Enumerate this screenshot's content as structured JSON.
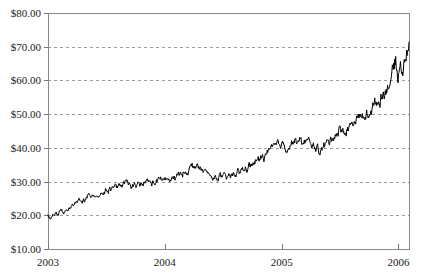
{
  "chart_data": {
    "type": "line",
    "title": "",
    "subtitle": "",
    "xlabel": "",
    "ylabel": "",
    "legend": [],
    "legend_position": "none",
    "grid": true,
    "grid_style": "horizontal-dashed",
    "background": "#ffffff",
    "series_color": "#000000",
    "xlim": [
      "2003",
      "2006.1"
    ],
    "ylim": [
      10,
      80
    ],
    "ytick_values": [
      10,
      20,
      30,
      40,
      50,
      60,
      70,
      80
    ],
    "ytick_labels": [
      "$10.00",
      "$20.00",
      "$30.00",
      "$40.00",
      "$50.00",
      "$60.00",
      "$70.00",
      "$80.00"
    ],
    "ytick_prefix": "$",
    "ytick_step": 10,
    "xtick_labels": [
      "2003",
      "2004",
      "2005",
      "2006"
    ],
    "xtick_positions": [
      0,
      1,
      2,
      3
    ],
    "x_span_years": 3.09,
    "series": [
      {
        "name": "price",
        "color": "#000000",
        "note": "daily closing price, ~780 points from start of 2003 to early 2006",
        "anchors": [
          {
            "x": 0.0,
            "y": 19.6
          },
          {
            "x": 0.02,
            "y": 19.2
          },
          {
            "x": 0.05,
            "y": 20.1
          },
          {
            "x": 0.08,
            "y": 20.5
          },
          {
            "x": 0.12,
            "y": 21.4
          },
          {
            "x": 0.16,
            "y": 21.1
          },
          {
            "x": 0.2,
            "y": 22.3
          },
          {
            "x": 0.24,
            "y": 23.6
          },
          {
            "x": 0.28,
            "y": 24.9
          },
          {
            "x": 0.31,
            "y": 24.2
          },
          {
            "x": 0.35,
            "y": 25.6
          },
          {
            "x": 0.39,
            "y": 26.4
          },
          {
            "x": 0.43,
            "y": 25.8
          },
          {
            "x": 0.47,
            "y": 26.9
          },
          {
            "x": 0.52,
            "y": 27.4
          },
          {
            "x": 0.56,
            "y": 28.8
          },
          {
            "x": 0.6,
            "y": 28.1
          },
          {
            "x": 0.65,
            "y": 29.6
          },
          {
            "x": 0.7,
            "y": 29.0
          },
          {
            "x": 0.75,
            "y": 28.4
          },
          {
            "x": 0.8,
            "y": 29.2
          },
          {
            "x": 0.85,
            "y": 30.1
          },
          {
            "x": 0.9,
            "y": 29.5
          },
          {
            "x": 0.95,
            "y": 30.4
          },
          {
            "x": 1.0,
            "y": 30.8
          },
          {
            "x": 1.05,
            "y": 30.2
          },
          {
            "x": 1.1,
            "y": 31.5
          },
          {
            "x": 1.15,
            "y": 32.4
          },
          {
            "x": 1.2,
            "y": 33.6
          },
          {
            "x": 1.25,
            "y": 34.8
          },
          {
            "x": 1.29,
            "y": 34.0
          },
          {
            "x": 1.33,
            "y": 33.1
          },
          {
            "x": 1.38,
            "y": 32.0
          },
          {
            "x": 1.42,
            "y": 30.8
          },
          {
            "x": 1.47,
            "y": 31.6
          },
          {
            "x": 1.52,
            "y": 31.0
          },
          {
            "x": 1.57,
            "y": 31.8
          },
          {
            "x": 1.62,
            "y": 32.6
          },
          {
            "x": 1.67,
            "y": 33.5
          },
          {
            "x": 1.72,
            "y": 34.4
          },
          {
            "x": 1.77,
            "y": 35.6
          },
          {
            "x": 1.82,
            "y": 36.8
          },
          {
            "x": 1.87,
            "y": 38.2
          },
          {
            "x": 1.92,
            "y": 39.6
          },
          {
            "x": 1.96,
            "y": 40.8
          },
          {
            "x": 2.0,
            "y": 41.4
          },
          {
            "x": 2.04,
            "y": 40.2
          },
          {
            "x": 2.08,
            "y": 41.0
          },
          {
            "x": 2.12,
            "y": 42.3
          },
          {
            "x": 2.16,
            "y": 41.5
          },
          {
            "x": 2.2,
            "y": 42.0
          },
          {
            "x": 2.25,
            "y": 41.2
          },
          {
            "x": 2.29,
            "y": 40.0
          },
          {
            "x": 2.33,
            "y": 39.4
          },
          {
            "x": 2.37,
            "y": 40.6
          },
          {
            "x": 2.41,
            "y": 42.2
          },
          {
            "x": 2.45,
            "y": 43.8
          },
          {
            "x": 2.5,
            "y": 45.4
          },
          {
            "x": 2.54,
            "y": 44.6
          },
          {
            "x": 2.58,
            "y": 46.2
          },
          {
            "x": 2.62,
            "y": 47.8
          },
          {
            "x": 2.66,
            "y": 49.4
          },
          {
            "x": 2.7,
            "y": 48.6
          },
          {
            "x": 2.74,
            "y": 50.2
          },
          {
            "x": 2.78,
            "y": 52.0
          },
          {
            "x": 2.82,
            "y": 53.6
          },
          {
            "x": 2.86,
            "y": 55.4
          },
          {
            "x": 2.89,
            "y": 57.2
          },
          {
            "x": 2.92,
            "y": 59.0
          },
          {
            "x": 2.94,
            "y": 61.2
          },
          {
            "x": 2.96,
            "y": 63.6
          },
          {
            "x": 2.975,
            "y": 65.8
          },
          {
            "x": 2.985,
            "y": 63.4
          },
          {
            "x": 2.995,
            "y": 60.6
          },
          {
            "x": 3.005,
            "y": 62.8
          },
          {
            "x": 3.02,
            "y": 64.6
          },
          {
            "x": 3.035,
            "y": 63.2
          },
          {
            "x": 3.05,
            "y": 65.4
          },
          {
            "x": 3.062,
            "y": 67.0
          },
          {
            "x": 3.074,
            "y": 68.4
          },
          {
            "x": 3.082,
            "y": 67.6
          },
          {
            "x": 3.09,
            "y": 69.8
          }
        ]
      }
    ]
  },
  "plot_geometry": {
    "left": 48,
    "right": 409,
    "top": 13,
    "bottom": 249
  }
}
